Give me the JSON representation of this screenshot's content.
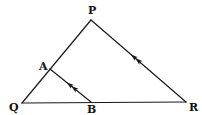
{
  "diagram": {
    "type": "triangle-with-parallel-line",
    "colors": {
      "stroke": "#1a1a1a",
      "label": "#111111",
      "background": "#ffffff"
    },
    "points": {
      "P": {
        "label": "P",
        "x": 91,
        "y": 20,
        "label_x": 88,
        "label_y": 14
      },
      "Q": {
        "label": "Q",
        "x": 22,
        "y": 103,
        "label_x": 9,
        "label_y": 111
      },
      "R": {
        "label": "R",
        "x": 186,
        "y": 102,
        "label_x": 189,
        "label_y": 111
      },
      "A": {
        "label": "A",
        "x": 50,
        "y": 69,
        "label_x": 39,
        "label_y": 70
      },
      "B": {
        "label": "B",
        "x": 91,
        "y": 102,
        "label_x": 91,
        "label_y": 113
      }
    },
    "segments": [
      {
        "name": "PQ",
        "from": "P",
        "to": "Q"
      },
      {
        "name": "QR",
        "from": "Q",
        "to": "R"
      },
      {
        "name": "PR",
        "from": "P",
        "to": "R",
        "arrow": "double-toward-P"
      },
      {
        "name": "AB",
        "from": "A",
        "to": "B",
        "arrow": "double-toward-A"
      }
    ],
    "annotation": "AB parallel to PR (indicated by matching arrow marks)"
  }
}
